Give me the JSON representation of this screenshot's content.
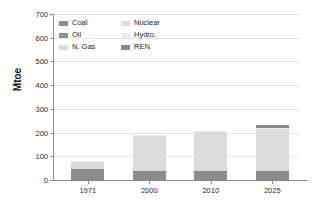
{
  "chart_data": {
    "type": "bar",
    "stacked": true,
    "title": "",
    "xlabel": "",
    "ylabel": "Mtoe",
    "ylim": [
      0,
      700
    ],
    "ytick_step": 100,
    "yticks": [
      0,
      100,
      200,
      300,
      400,
      500,
      600,
      700
    ],
    "ytick_labels": [
      "0",
      "100",
      "200",
      "300",
      "400",
      "500",
      "600",
      "700"
    ],
    "categories": [
      "1971",
      "2000",
      "2010",
      "2025"
    ],
    "grid": true,
    "legend_position": "upper-left",
    "series": [
      {
        "name": "Coal",
        "color": "#8c8c8c",
        "values": [
          48,
          36,
          40,
          40
        ]
      },
      {
        "name": "Oil",
        "color": "#8f8f8f",
        "values": [
          0,
          0,
          0,
          0
        ]
      },
      {
        "name": "N. Gas",
        "color": "#d9d9d9",
        "values": [
          0,
          0,
          0,
          0
        ]
      },
      {
        "name": "Nuclear",
        "color": "#dcdcdc",
        "values": [
          30,
          148,
          163,
          177
        ]
      },
      {
        "name": "Hydro.",
        "color": "#ebebeb",
        "values": [
          2,
          6,
          2,
          2
        ]
      },
      {
        "name": "REN",
        "color": "#8a8a8a",
        "values": [
          0,
          0,
          0,
          13
        ]
      }
    ],
    "totals": [
      80,
      190,
      205,
      232
    ]
  },
  "legend": {
    "items": [
      {
        "label": "Coal",
        "color": "#8c8c8c"
      },
      {
        "label": "Nuclear",
        "color": "#dcdcdc"
      },
      {
        "label": "Oil",
        "color": "#8f8f8f"
      },
      {
        "label": "Hydro.",
        "color": "#ebebeb"
      },
      {
        "label": "N. Gas",
        "color": "#d9d9d9"
      },
      {
        "label": "REN",
        "color": "#8a8a8a"
      }
    ]
  },
  "axis": {
    "y_title": "Mtoe"
  }
}
